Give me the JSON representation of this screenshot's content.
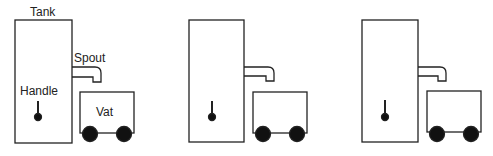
{
  "labels": {
    "tank": "Tank",
    "spout": "Spout",
    "handle": "Handle",
    "vat": "Vat"
  },
  "figures": [
    {
      "id": 1,
      "offset_x": 0,
      "labeled": true
    },
    {
      "id": 2,
      "offset_x": 173,
      "labeled": false
    },
    {
      "id": 3,
      "offset_x": 344,
      "labeled": false
    }
  ],
  "colors": {
    "stroke": "#222222",
    "fill": "#111111"
  }
}
